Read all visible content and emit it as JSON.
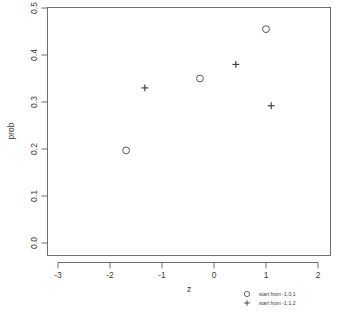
{
  "chart_data": {
    "type": "scatter",
    "title": "",
    "xlabel": "z",
    "ylabel": "prob",
    "xlim": [
      -3.3,
      2.3
    ],
    "ylim": [
      -0.01,
      0.52
    ],
    "xticks": [
      -3,
      -2,
      -1,
      0,
      1,
      2
    ],
    "xtick_labels": [
      "-3",
      "-2",
      "-1",
      "0",
      "1",
      "2"
    ],
    "yticks": [
      0.0,
      0.1,
      0.2,
      0.3,
      0.4,
      0.5
    ],
    "ytick_labels": [
      "0.0",
      "0.1",
      "0.2",
      "0.3",
      "0.4",
      "0.5"
    ],
    "grid": false,
    "legend_position": "bottom-right",
    "series": [
      {
        "name": "start from -1,0,1",
        "marker": "circle",
        "color": "#555555",
        "points": [
          {
            "x": -1.69,
            "y": 0.197
          },
          {
            "x": -0.27,
            "y": 0.35
          },
          {
            "x": 1.0,
            "y": 0.455
          }
        ]
      },
      {
        "name": "start from -1,1,2",
        "marker": "plus",
        "color": "#333333",
        "points": [
          {
            "x": -1.33,
            "y": 0.33
          },
          {
            "x": 0.42,
            "y": 0.38
          },
          {
            "x": 1.1,
            "y": 0.292
          }
        ]
      }
    ]
  }
}
